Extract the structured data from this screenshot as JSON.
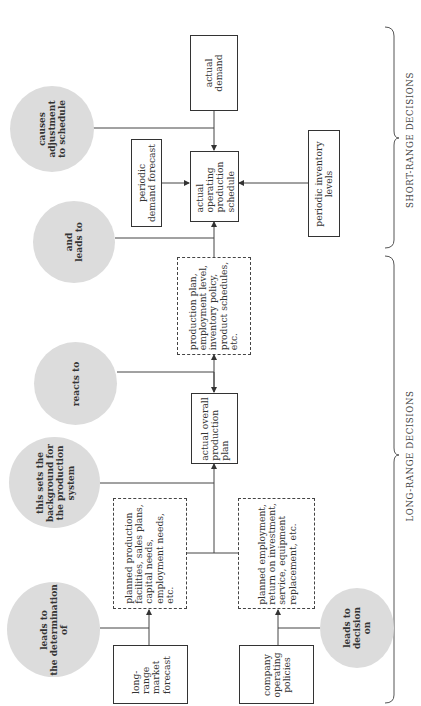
{
  "diagram": {
    "type": "flowchart",
    "orientation": "rotated -90deg (reads bottom-to-top)",
    "sections": {
      "short_range": "SHORT-RANGE DECISIONS",
      "long_range": "LONG-RANGE DECISIONS"
    },
    "boxes": {
      "actual_demand": "actual\ndemand",
      "actual_operating_schedule": "actual\noperating\nproduction\nschedule",
      "periodic_demand_forecast": "periodic\ndemand forecast",
      "periodic_inventory_levels": "periodic inventory\nlevels",
      "production_plan_details": "production plan,\nemployment level,\ninventory policy,\nproduct schedules,\netc.",
      "actual_overall_plan": "actual overall\nproduction\nplan",
      "planned_production_facilities": "planned production\nfacilities, sales plans,\ncapital needs,\nemployment needs,\netc.",
      "planned_employment": "planned employment,\nreturn on investment,\nservice, equipment\nreplacement, etc.",
      "long_range_market_forecast": "long-\nrange\nmarket\nforecast",
      "company_operating_policies": "company\noperating\npolicies"
    },
    "annotations": {
      "causes_adjustment": "causes\nadjustment\nto schedule",
      "and_leads_to": "and\nleads to",
      "reacts_to": "reacts to",
      "sets_background": "this sets the\nbackground for\nthe production\nsystem",
      "leads_to_determination": "leads to\nthe determination\nof",
      "leads_to_decision": "leads to\ndecision\non"
    },
    "colors": {
      "annotation_fill": "#dcdcdc",
      "line": "#333333"
    }
  }
}
